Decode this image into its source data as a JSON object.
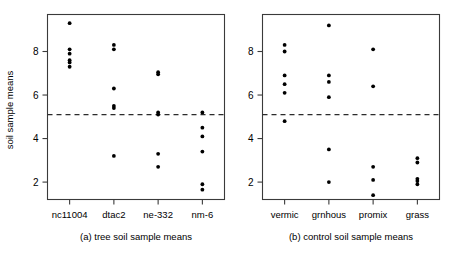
{
  "figure": {
    "ylabel": "soil sample means",
    "y_ticks": [
      "2",
      "4",
      "6",
      "8"
    ],
    "y_tick_values": [
      2,
      4,
      6,
      8
    ]
  },
  "chart_data": [
    {
      "type": "scatter",
      "title": "(a) tree soil sample means",
      "xlabel": "",
      "ylabel": "soil sample means",
      "ylim": [
        1.2,
        9.7
      ],
      "yticks": [
        2,
        4,
        6,
        8
      ],
      "grid": false,
      "legend": "none",
      "categories": [
        "nc11004",
        "dtac2",
        "ne-332",
        "nm-6"
      ],
      "reference_line": {
        "type": "horizontal",
        "value": 5.1,
        "style": "dashed"
      },
      "series": [
        {
          "name": "nc11004",
          "values": [
            9.3,
            8.1,
            7.9,
            7.6,
            7.5,
            7.3
          ]
        },
        {
          "name": "dtac2",
          "values": [
            8.3,
            8.1,
            6.3,
            5.5,
            5.4,
            3.2
          ]
        },
        {
          "name": "ne-332",
          "values": [
            7.05,
            6.95,
            5.2,
            5.1,
            3.3,
            2.7
          ]
        },
        {
          "name": "nm-6",
          "values": [
            5.2,
            4.5,
            4.1,
            3.4,
            1.9,
            1.65
          ]
        }
      ]
    },
    {
      "type": "scatter",
      "title": "(b) control soil sample means",
      "xlabel": "",
      "ylabel": "",
      "ylim": [
        1.2,
        9.7
      ],
      "yticks": [
        2,
        4,
        6,
        8
      ],
      "grid": false,
      "legend": "none",
      "categories": [
        "vermic",
        "grnhous",
        "promix",
        "grass"
      ],
      "reference_line": {
        "type": "horizontal",
        "value": 5.1,
        "style": "dashed"
      },
      "series": [
        {
          "name": "vermic",
          "values": [
            8.3,
            8.0,
            6.9,
            6.5,
            6.1,
            4.8
          ]
        },
        {
          "name": "grnhous",
          "values": [
            9.2,
            6.9,
            6.6,
            5.9,
            3.5,
            2.0
          ]
        },
        {
          "name": "promix",
          "values": [
            8.1,
            6.4,
            2.7,
            2.1,
            1.4
          ]
        },
        {
          "name": "grass",
          "values": [
            3.1,
            2.9,
            2.15,
            2.05,
            1.9
          ]
        }
      ]
    }
  ],
  "panels": [
    {
      "name": "tree-panel",
      "caption": "(a) tree soil sample means",
      "categories": [
        "nc11004",
        "dtac2",
        "ne-332",
        "nm-6"
      ]
    },
    {
      "name": "control-panel",
      "caption": "(b) control soil sample means",
      "categories": [
        "vermic",
        "grnhous",
        "promix",
        "grass"
      ]
    }
  ]
}
